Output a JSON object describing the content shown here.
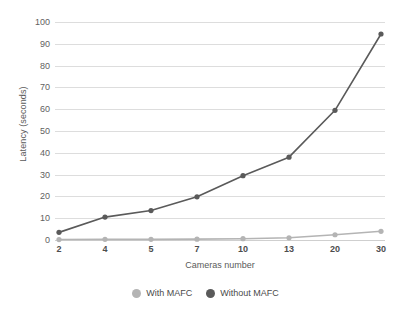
{
  "chart_data": {
    "type": "line",
    "title": "",
    "xlabel": "Cameras number",
    "ylabel": "Latency (seconds)",
    "categories": [
      "2",
      "4",
      "5",
      "7",
      "10",
      "13",
      "20",
      "30"
    ],
    "ylim": [
      0,
      100
    ],
    "yticks": [
      "0",
      "10",
      "20",
      "30",
      "40",
      "50",
      "60",
      "70",
      "80",
      "90",
      "100"
    ],
    "grid": true,
    "legend_position": "bottom",
    "series": [
      {
        "name": "With MAFC",
        "color": "#b4b4b4",
        "values": [
          0.2,
          0.3,
          0.3,
          0.4,
          0.6,
          1.0,
          2.4,
          4.0
        ]
      },
      {
        "name": "Without MAFC",
        "color": "#5a5a5a",
        "values": [
          3.5,
          10.5,
          13.5,
          19.8,
          29.5,
          38,
          59.5,
          94.5
        ]
      }
    ]
  },
  "colors": {
    "grid": "#dddddd",
    "axis_text": "#5a5a5a",
    "with_mafc": "#b4b4b4",
    "without_mafc": "#5a5a5a",
    "background": "#ffffff"
  }
}
